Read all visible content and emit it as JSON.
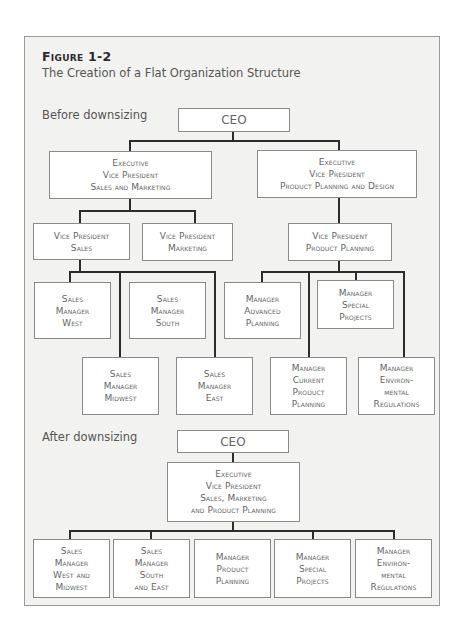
{
  "figure": {
    "label": "Figure 1-2",
    "title": "The Creation of a Flat Organization Structure"
  },
  "before": {
    "section_label": "Before downsizing",
    "ceo": [
      "CEO"
    ],
    "evp_sales_marketing": [
      "Executive",
      "Vice President",
      "Sales and Marketing"
    ],
    "evp_product_planning_design": [
      "Executive",
      "Vice President",
      "Product Planning and Design"
    ],
    "vp_sales": [
      "Vice President",
      "Sales"
    ],
    "vp_marketing": [
      "Vice President",
      "Marketing"
    ],
    "vp_product_planning": [
      "Vice President",
      "Product Planning"
    ],
    "sm_west": [
      "Sales",
      "Manager",
      "West"
    ],
    "sm_south": [
      "Sales",
      "Manager",
      "South"
    ],
    "sm_midwest": [
      "Sales",
      "Manager",
      "Midwest"
    ],
    "sm_east": [
      "Sales",
      "Manager",
      "East"
    ],
    "mgr_advanced_planning": [
      "Manager",
      "Advanced",
      "Planning"
    ],
    "mgr_special_projects": [
      "Manager",
      "Special",
      "Projects"
    ],
    "mgr_current_product_planning": [
      "Manager",
      "Current",
      "Product",
      "Planning"
    ],
    "mgr_environmental_regulations": [
      "Manager",
      "Environ-",
      "mental",
      "Regulations"
    ]
  },
  "after": {
    "section_label": "After downsizing",
    "ceo": [
      "CEO"
    ],
    "evp_combined": [
      "Executive",
      "Vice President",
      "Sales, Marketing",
      "and Product Planning"
    ],
    "sm_west_midwest": [
      "Sales",
      "Manager",
      "West and",
      "Midwest"
    ],
    "sm_south_east": [
      "Sales",
      "Manager",
      "South",
      "and East"
    ],
    "mgr_product_planning": [
      "Manager",
      "Product",
      "Planning"
    ],
    "mgr_special_projects": [
      "Manager",
      "Special",
      "Projects"
    ],
    "mgr_environmental_regulations": [
      "Manager",
      "Environ-",
      "mental",
      "Regulations"
    ]
  },
  "colors": {
    "frame_background": "#f2f2f0",
    "frame_border": "#9a9a9a",
    "box_border": "#8a8a8a",
    "connector": "#2c2c2c"
  }
}
